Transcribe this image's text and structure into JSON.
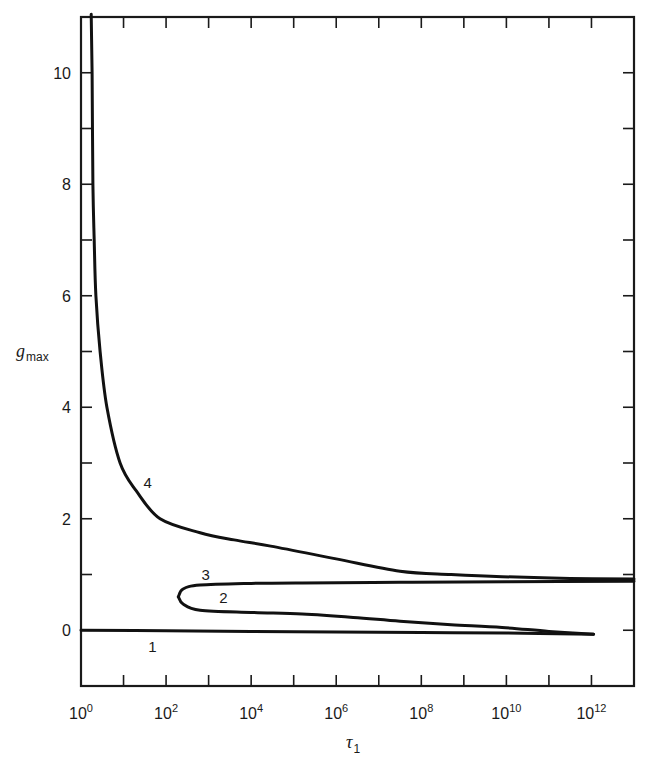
{
  "chart_data": {
    "type": "line",
    "title": "",
    "xlabel": "τ1",
    "ylabel": "g_max",
    "xlabel_main": "τ",
    "xlabel_sub": "1",
    "ylabel_main": "g",
    "ylabel_sub": "max",
    "x_scale": "log",
    "xlim_log10": [
      0,
      13
    ],
    "ylim": [
      -1,
      11
    ],
    "grid": false,
    "legend": "none (curves labeled inline with numbers)",
    "x_ticks": [
      {
        "log10": 0,
        "base": "10",
        "exp": "0"
      },
      {
        "log10": 2,
        "base": "10",
        "exp": "2"
      },
      {
        "log10": 4,
        "base": "10",
        "exp": "4"
      },
      {
        "log10": 6,
        "base": "10",
        "exp": "6"
      },
      {
        "log10": 8,
        "base": "10",
        "exp": "8"
      },
      {
        "log10": 10,
        "base": "10",
        "exp": "10"
      },
      {
        "log10": 12,
        "base": "10",
        "exp": "12"
      }
    ],
    "x_minor_ticks_log10": [
      1,
      3,
      5,
      7,
      9,
      11
    ],
    "y_ticks": [
      {
        "value": 0,
        "label": "0"
      },
      {
        "value": 2,
        "label": "2"
      },
      {
        "value": 4,
        "label": "4"
      },
      {
        "value": 6,
        "label": "6"
      },
      {
        "value": 8,
        "label": "8"
      },
      {
        "value": 10,
        "label": "10"
      }
    ],
    "y_minor_ticks": [
      1,
      3,
      5,
      7,
      9
    ],
    "series": [
      {
        "name": "1",
        "label_pos": {
          "log10_x": 1.68,
          "y": -0.3
        },
        "points_log10x_y": [
          [
            0,
            0.0
          ],
          [
            2,
            -0.01
          ],
          [
            4,
            -0.02
          ],
          [
            6,
            -0.03
          ],
          [
            8,
            -0.04
          ],
          [
            10,
            -0.05
          ],
          [
            12.05,
            -0.07
          ]
        ]
      },
      {
        "name": "2",
        "label_pos": {
          "log10_x": 3.35,
          "y": 0.58
        },
        "points_log10x_y": [
          [
            2.29,
            0.6
          ],
          [
            2.4,
            0.47
          ],
          [
            2.8,
            0.36
          ],
          [
            4.0,
            0.32
          ],
          [
            5.2,
            0.29
          ],
          [
            6.4,
            0.23
          ],
          [
            7.5,
            0.16
          ],
          [
            8.7,
            0.1
          ],
          [
            9.9,
            0.05
          ],
          [
            11.0,
            -0.02
          ],
          [
            12.05,
            -0.07
          ]
        ]
      },
      {
        "name": "3",
        "label_pos": {
          "log10_x": 2.93,
          "y": 0.99
        },
        "points_log10x_y": [
          [
            2.29,
            0.6
          ],
          [
            2.4,
            0.74
          ],
          [
            2.8,
            0.81
          ],
          [
            4.0,
            0.84
          ],
          [
            5.2,
            0.85
          ],
          [
            7.5,
            0.86
          ],
          [
            10.0,
            0.87
          ],
          [
            13.0,
            0.88
          ]
        ]
      },
      {
        "name": "4",
        "label_pos": {
          "log10_x": 1.57,
          "y": 2.65
        },
        "points_log10x_y": [
          [
            0.24,
            11.05
          ],
          [
            0.26,
            10.0
          ],
          [
            0.28,
            8.0
          ],
          [
            0.31,
            7.0
          ],
          [
            0.35,
            6.0
          ],
          [
            0.45,
            5.0
          ],
          [
            0.61,
            4.0
          ],
          [
            0.92,
            3.0
          ],
          [
            1.3,
            2.5
          ],
          [
            1.86,
            2.0
          ],
          [
            2.8,
            1.75
          ],
          [
            3.6,
            1.62
          ],
          [
            4.46,
            1.51
          ],
          [
            6.0,
            1.28
          ],
          [
            7.5,
            1.06
          ],
          [
            8.7,
            1.0
          ],
          [
            9.9,
            0.96
          ],
          [
            11.5,
            0.93
          ],
          [
            13.0,
            0.92
          ]
        ]
      }
    ]
  }
}
